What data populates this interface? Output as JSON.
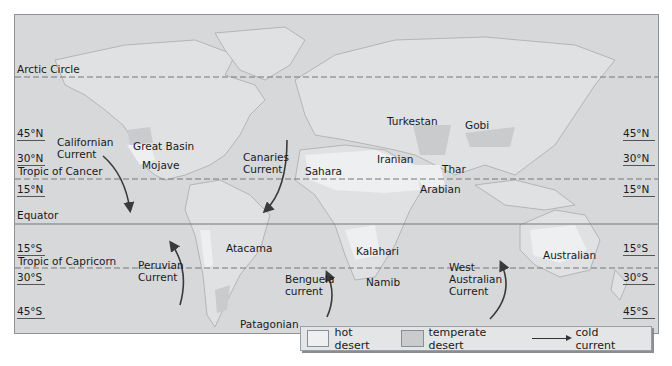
{
  "map": {
    "colors": {
      "ocean": "#d6d8da",
      "land": "#dfe1e2",
      "hot_desert": "#eeeff0",
      "temperate_desert": "#c9cbcd",
      "coastline": "#a8abae",
      "current_arrow": "#3a3a3a",
      "line": "#777777"
    },
    "reference_lines": [
      {
        "name": "Arctic Circle",
        "style": "dashed"
      },
      {
        "name": "Tropic of Cancer",
        "style": "dashed"
      },
      {
        "name": "Equator",
        "style": "solid"
      },
      {
        "name": "Tropic of Capricorn",
        "style": "dashed"
      }
    ],
    "left_labels": {
      "arctic": "Arctic Circle",
      "n45": "45°N",
      "n30": "30°N",
      "cancer": "Tropic of Cancer",
      "n15": "15°N",
      "equator": "Equator",
      "s15": "15°S",
      "capricorn": "Tropic of Capricorn",
      "s30": "30°S",
      "s45": "45°S"
    },
    "right_labels": {
      "n45": "45°N",
      "n30": "30°N",
      "n15": "15°N",
      "s15": "15°S",
      "s30": "30°S",
      "s45": "45°S"
    },
    "deserts": {
      "great_basin": "Great Basin",
      "mojave": "Mojave",
      "sahara": "Sahara",
      "iranian": "Iranian",
      "turkestan": "Turkestan",
      "gobi": "Gobi",
      "thar": "Thar",
      "arabian": "Arabian",
      "atacama": "Atacama",
      "patagonian": "Patagonian",
      "kalahari": "Kalahari",
      "namib": "Namib",
      "australian": "Australian"
    },
    "currents": {
      "californian_1": "Californian",
      "californian_2": "Current",
      "canaries_1": "Canaries",
      "canaries_2": "Current",
      "peruvian_1": "Peruvian",
      "peruvian_2": "Current",
      "benguela_1": "Benguela",
      "benguela_2": "current",
      "west_australian_1": "West",
      "west_australian_2": "Australian",
      "west_australian_3": "Current"
    }
  },
  "legend": {
    "hot_desert": "hot desert",
    "temperate_desert": "temperate desert",
    "cold_current": "cold current"
  }
}
